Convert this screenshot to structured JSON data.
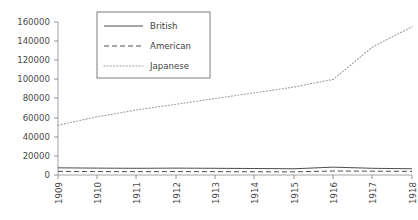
{
  "chart_data": {
    "type": "line",
    "title": "",
    "xlabel": "",
    "ylabel": "",
    "x": [
      1909,
      1910,
      1911,
      1912,
      1913,
      1914,
      1915,
      1916,
      1917,
      1918
    ],
    "categories": [
      "1909",
      "1910",
      "1911",
      "1912",
      "1913",
      "1914",
      "1915",
      "1916",
      "1917",
      "1918"
    ],
    "xlim": [
      1909,
      1918
    ],
    "ylim": [
      0,
      160000
    ],
    "ytick_values": [
      0,
      20000,
      40000,
      60000,
      80000,
      100000,
      120000,
      140000,
      160000
    ],
    "ytick_labels": [
      "0",
      "20000",
      "40000",
      "60000",
      "80000",
      "100000",
      "120000",
      "140000",
      "160000"
    ],
    "grid": false,
    "legend_position": "upper-left-inset",
    "series": [
      {
        "name": "British",
        "linestyle": "solid",
        "color": "#4d4d4d",
        "values": [
          7500,
          7200,
          7000,
          7200,
          7000,
          6800,
          6500,
          8200,
          7000,
          6500
        ]
      },
      {
        "name": "American",
        "linestyle": "dashed",
        "color": "#4d4d4d",
        "values": [
          3800,
          3600,
          3500,
          3600,
          3500,
          3400,
          3300,
          4200,
          4000,
          3800
        ]
      },
      {
        "name": "Japanese",
        "linestyle": "dotted",
        "color": "#9a9a9a",
        "values": [
          52000,
          61000,
          68000,
          74000,
          80000,
          86000,
          92000,
          100000,
          134000,
          155000
        ]
      }
    ]
  },
  "legend": {
    "entries": [
      {
        "label": "British",
        "style": "solid"
      },
      {
        "label": "American",
        "style": "dashed"
      },
      {
        "label": "Japanese",
        "style": "dotted"
      }
    ]
  },
  "axes": {
    "y_labels": [
      "160000",
      "140000",
      "120000",
      "100000",
      "80000",
      "60000",
      "40000",
      "20000",
      "0"
    ],
    "x_labels": [
      "1909",
      "1910",
      "1911",
      "1912",
      "1913",
      "1914",
      "1915",
      "1916",
      "1917",
      "1918"
    ]
  },
  "colors": {
    "background": "#ffffff",
    "axis": "#808080",
    "text": "#3f3f3f",
    "series_dark": "#4d4d4d",
    "series_light": "#9a9a9a"
  }
}
